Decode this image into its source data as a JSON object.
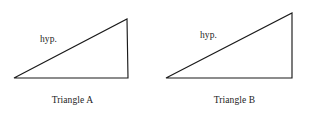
{
  "figure": {
    "background_color": "#ffffff",
    "stroke_color": "#1a1a1a",
    "text_color": "#1c1c1c",
    "width": 309,
    "height": 113
  },
  "triangles": [
    {
      "id": "triangle-a",
      "caption": "Triangle A",
      "hypotenuse_label": "hyp.",
      "vertices": {
        "bottom_left": [
          14,
          78
        ],
        "bottom_right": [
          128,
          78
        ],
        "apex": [
          127,
          19
        ]
      },
      "points_attr": "14,78 128,78 127,19 14,78"
    },
    {
      "id": "triangle-b",
      "caption": "Triangle B",
      "hypotenuse_label": "hyp.",
      "vertices": {
        "bottom_left": [
          166,
          78
        ],
        "bottom_right": [
          292,
          78
        ],
        "apex": [
          292,
          13
        ]
      },
      "points_attr": "166,78 292,78 292,13 166,78"
    }
  ]
}
